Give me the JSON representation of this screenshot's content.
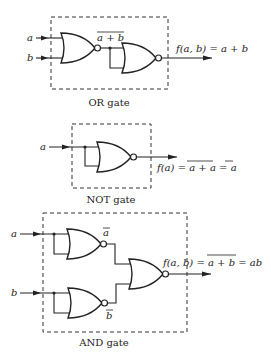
{
  "figure": {
    "diagrams": [
      {
        "id": "or",
        "caption": "OR gate",
        "inputs": [
          "a",
          "b"
        ],
        "intermediate_label": "a + b",
        "output_label": "f(a, b) = a + b",
        "gate_type": "NOR"
      },
      {
        "id": "not",
        "caption": "NOT gate",
        "inputs": [
          "a"
        ],
        "output_label_prefix": "f(a) = ",
        "output_label_overlined": "a + a",
        "output_label_eq": " = ",
        "output_label_result": "a",
        "gate_type": "NOR"
      },
      {
        "id": "and",
        "caption": "AND gate",
        "inputs": [
          "a",
          "b"
        ],
        "intermediate_labels": [
          "a",
          "b"
        ],
        "output_label_prefix": "f(a, b) = ",
        "output_label_overlined": "a + b",
        "output_label_suffix": " = ab",
        "gate_type": "NOR"
      }
    ]
  }
}
